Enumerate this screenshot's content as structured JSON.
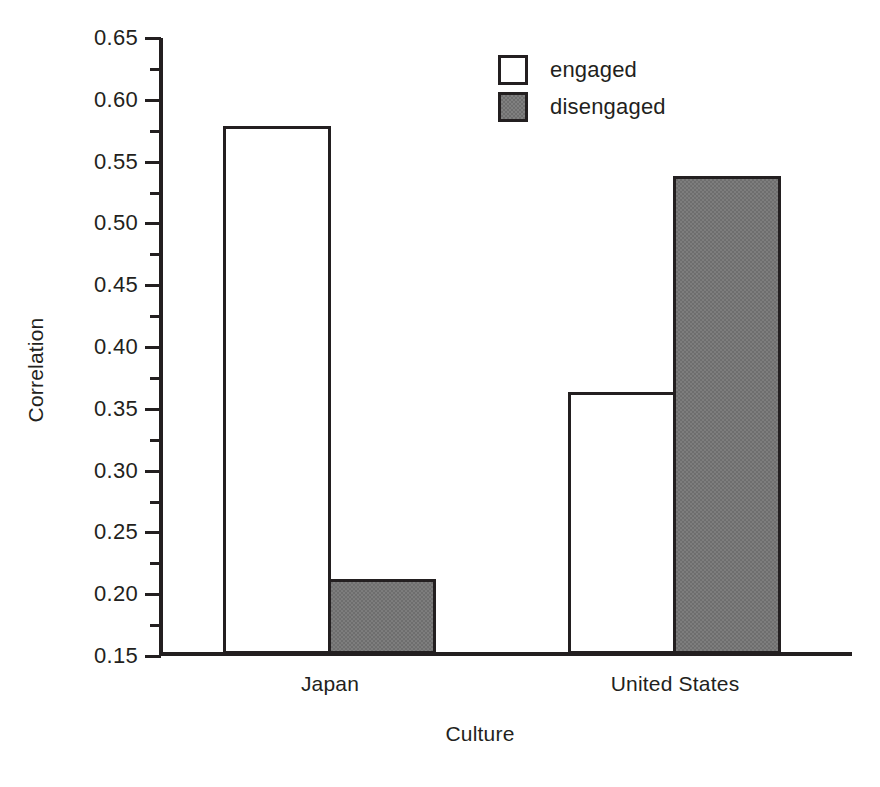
{
  "chart_data": {
    "type": "bar",
    "title": "",
    "xlabel": "Culture",
    "ylabel": "Correlation",
    "categories": [
      "Japan",
      "United States"
    ],
    "series": [
      {
        "name": "engaged",
        "values": [
          0.577,
          0.362
        ],
        "fill": "#ffffff",
        "edge": "#231f20"
      },
      {
        "name": "disengaged",
        "values": [
          0.211,
          0.537
        ],
        "fill": "#6e6e6e",
        "edge": "#231f20"
      }
    ],
    "ylim": [
      0.15,
      0.65
    ],
    "ytick_labels": [
      "0.65",
      "0.60",
      "0.55",
      "0.50",
      "0.45",
      "0.40",
      "0.35",
      "0.30",
      "0.25",
      "0.20",
      "0.15"
    ],
    "ytick_values": [
      0.65,
      0.6,
      0.55,
      0.5,
      0.45,
      0.4,
      0.35,
      0.3,
      0.25,
      0.2,
      0.15
    ],
    "yminor_values": [
      0.625,
      0.575,
      0.525,
      0.475,
      0.425,
      0.375,
      0.325,
      0.275,
      0.225,
      0.175
    ],
    "grid": false,
    "legend_position": "upper center",
    "legend_entries": [
      "engaged",
      "disengaged"
    ]
  }
}
